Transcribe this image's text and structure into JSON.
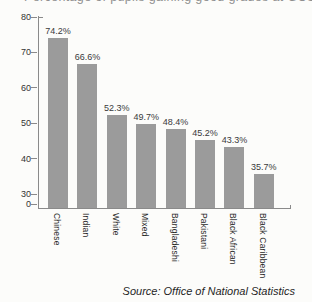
{
  "clipped_title": "Percentage of pupils gaining good grades at GCSE",
  "source": "Source: Office of National Statistics",
  "colors": {
    "bar": "#9b9b9b",
    "axis": "#8a8a8a",
    "tick_text": "#333333",
    "value_text": "#3a3a3a",
    "category_text": "#2b2b2b",
    "title_text": "#8f8f8f",
    "background": "#fcfcfa"
  },
  "chart_data": {
    "type": "bar",
    "categories": [
      "Chinese",
      "Indian",
      "White",
      "Mixed",
      "Bangladeshi",
      "Pakistani",
      "Black African",
      "Black Caribbean"
    ],
    "values": [
      74.2,
      66.6,
      52.3,
      49.7,
      48.4,
      45.2,
      43.3,
      35.7
    ],
    "value_labels": [
      "74.2%",
      "66.6%",
      "52.3%",
      "49.7%",
      "48.4%",
      "45.2%",
      "43.3%",
      "35.7%"
    ],
    "title": "Percentage of pupils gaining good grades at GCSE",
    "xlabel": "",
    "ylabel": "",
    "y_ticks": [
      80,
      70,
      60,
      50,
      40,
      30,
      0
    ],
    "ylim": [
      30,
      80
    ],
    "axis_break": "scale compressed between 0 and 30",
    "grid": false,
    "legend": "none",
    "annotation": "Source: Office of National Statistics"
  }
}
